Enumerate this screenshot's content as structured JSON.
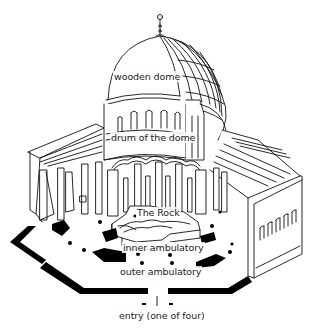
{
  "diagram": {
    "type": "architectural-cutaway",
    "labels": {
      "wooden_dome": "wooden dome",
      "drum": "drum of the dome",
      "rock": "The Rock",
      "inner_ambulatory": "inner ambulatory",
      "outer_ambulatory": "outer ambulatory",
      "entry": "entry (one of four)"
    },
    "colors": {
      "line": "#111111",
      "fill": "#ffffff",
      "plan": "#000000"
    }
  }
}
